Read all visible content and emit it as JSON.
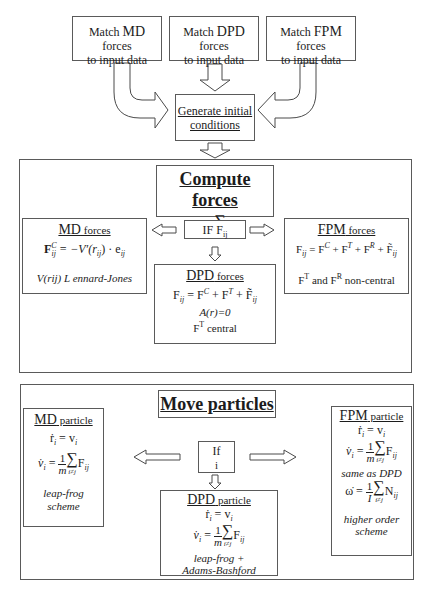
{
  "top": {
    "match_boxes": [
      {
        "prefix": "Match ",
        "method": "MD",
        "suffix": " forces",
        "line2": "to input data"
      },
      {
        "prefix": "Match ",
        "method": "DPD",
        "suffix": " forces",
        "line2": "to input data"
      },
      {
        "prefix": "Match ",
        "method": "FPM",
        "suffix": " forces",
        "line2": "to input data"
      }
    ],
    "generate": {
      "line1": "Generate initial",
      "line2": "conditions"
    }
  },
  "compute": {
    "title": "Compute forces",
    "equation": {
      "lhs": "F",
      "lhs_sub": "i",
      "sum_limit": "i≠j",
      "rhs": "F",
      "rhs_sub": "ij"
    },
    "condition": {
      "label": "IF F",
      "sub": "ij"
    },
    "md": {
      "title_method": "MD",
      "title_rest": " forces",
      "equation": "F_ij^C = −V′(r_ij) · e_ij",
      "note": "V(rij)  L ennard-Jones"
    },
    "dpd": {
      "title_method": "DPD",
      "title_rest": " forces",
      "equation": "F_ij = F_ij^C + F_ij^T + F̃_ij",
      "note1": "A(r)=0",
      "note2_prefix": "F",
      "note2_sup": "T",
      "note2_suffix": " central"
    },
    "fpm": {
      "title_method": "FPM",
      "title_rest": " forces",
      "equation": "F_ij = F_ij^C + F_ij^T + F_ij^R + F̃_ij",
      "note_a": "F",
      "note_a_sup": "T",
      "note_mid": " and F",
      "note_b_sup": "R",
      "note_suffix": "  non-central"
    }
  },
  "move": {
    "title": "Move particles",
    "condition": {
      "line1": "If",
      "line2": "i"
    },
    "md": {
      "title_method": "MD",
      "title_rest": " particle",
      "eq1": "ṙ_i = v_i",
      "eq2": "v̇_i = (1/m) Σ_{i≠j} F_ij",
      "note1": "leap-frog",
      "note2": "scheme"
    },
    "dpd": {
      "title_method": "DPD",
      "title_rest": " particle",
      "eq1": "ṙ_i = v_i",
      "eq2": "v̇_i = (1/m) Σ_{i≠j} F_ij",
      "note1": "leap-frog +",
      "note2": "Adams-Bashford"
    },
    "fpm": {
      "title_method": "FPM",
      "title_rest": " particle",
      "eq1": "ṙ_i = v_i",
      "eq2": "v̇_i = (1/m) Σ_{i≠j} F_ij",
      "note_same": "same as DPD",
      "eq3": "ω̇ = (1/I) Σ_{i≠j} N_ij",
      "note1": "higher order",
      "note2": "scheme"
    }
  },
  "math": {
    "F": "F",
    "r_dot": "ṙ",
    "v": "v",
    "v_dot": "v̇",
    "omega_dot": "ω̇",
    "N": "N",
    "eq": " = ",
    "plus": " + ",
    "one": "1",
    "m": "m",
    "I": "I",
    "sigma": "∑",
    "sub_i": "i",
    "sub_ij": "ij",
    "limit": "i≠j",
    "sup_C": "C",
    "sup_T": "T",
    "sup_R": "R",
    "F_tilde": "F̃",
    "md_rhs": " = −V′(r",
    "md_rhs2": ") · e",
    "close": ""
  }
}
